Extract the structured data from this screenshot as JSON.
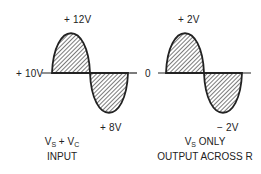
{
  "left_waveform": {
    "peak_label": "+ 12V",
    "baseline_label": "+ 10V",
    "trough_label": "+ 8V",
    "caption_line1_v1": "V",
    "caption_line1_sub1": "S",
    "caption_line1_mid": " + V",
    "caption_line1_sub2": "C",
    "caption_line2": "INPUT"
  },
  "right_waveform": {
    "peak_label": "+ 2V",
    "baseline_label": "0",
    "trough_label": "− 2V",
    "caption_line1_v": "V",
    "caption_line1_sub": "S",
    "caption_line1_rest": " ONLY",
    "caption_line2": "OUTPUT ACROSS R"
  },
  "colors": {
    "line": "#222222",
    "hatch": "#333333",
    "background": "#ffffff"
  }
}
